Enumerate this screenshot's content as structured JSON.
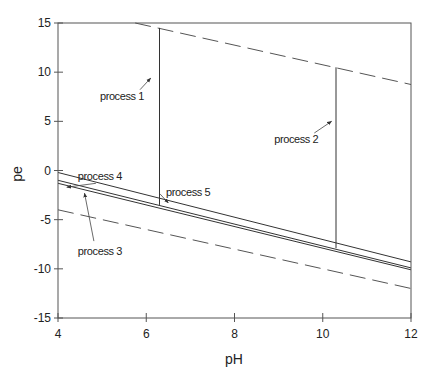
{
  "chart_data": {
    "type": "line",
    "title": "",
    "xlabel": "pH",
    "ylabel": "pe",
    "xlim": [
      4,
      12
    ],
    "ylim": [
      -15,
      15
    ],
    "xticks": [
      4,
      6,
      8,
      10,
      12
    ],
    "yticks": [
      15,
      10,
      5,
      0,
      -5,
      -10,
      -15
    ],
    "grid": false,
    "legend": null,
    "series": [
      {
        "name": "upper water stability limit (O2/H2O)",
        "style": "dashed",
        "x": [
          5.75,
          12
        ],
        "y": [
          15,
          8.75
        ]
      },
      {
        "name": "lower water stability limit (H2O/H2)",
        "style": "dashed",
        "x": [
          4,
          12
        ],
        "y": [
          -4,
          -12
        ]
      },
      {
        "name": "equilibrium line A",
        "style": "solid",
        "x": [
          4,
          12
        ],
        "y": [
          -0.2,
          -9.3
        ]
      },
      {
        "name": "equilibrium line B",
        "style": "solid",
        "x": [
          4,
          12
        ],
        "y": [
          -1.0,
          -9.9
        ]
      },
      {
        "name": "equilibrium line C",
        "style": "solid",
        "x": [
          4,
          12
        ],
        "y": [
          -1.3,
          -10.1
        ]
      },
      {
        "name": "process 1 path",
        "style": "solid",
        "x": [
          6.3,
          6.3
        ],
        "y": [
          -3.5,
          14.5
        ]
      },
      {
        "name": "process 2 path",
        "style": "solid",
        "x": [
          10.3,
          10.3
        ],
        "y": [
          -7.9,
          10.5
        ]
      }
    ],
    "annotations": [
      {
        "text": "process 1",
        "label_x": 5.45,
        "label_y": 7.2,
        "arrow_to": [
          6.1,
          9.4
        ]
      },
      {
        "text": "process 2",
        "label_x": 9.4,
        "label_y": 2.8,
        "arrow_to": [
          10.2,
          5.0
        ]
      },
      {
        "text": "process 3",
        "label_x": 4.95,
        "label_y": -8.6,
        "arrow_to": [
          4.6,
          -2.3
        ]
      },
      {
        "text": "process 4",
        "label_x": 4.95,
        "label_y": -1.0,
        "arrow_to": [
          4.2,
          -1.7
        ]
      },
      {
        "text": "process 5",
        "label_x": 6.95,
        "label_y": -2.6,
        "arrow_to": [
          6.5,
          -3.3
        ]
      }
    ]
  }
}
